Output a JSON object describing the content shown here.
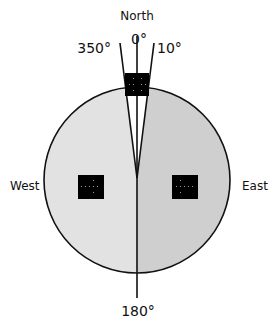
{
  "diagram": {
    "labels": {
      "north": "North",
      "deg0": "0°",
      "deg350": "350°",
      "deg10": "10°",
      "west": "West",
      "east": "East",
      "deg180": "180°"
    },
    "colors": {
      "west_half": "#e2e2e2",
      "east_half": "#cfcfcf",
      "wedge": "#ffffff",
      "stroke": "#111111",
      "marker": "#000000"
    },
    "markers": [
      {
        "name": "north-marker",
        "region": "north wedge"
      },
      {
        "name": "west-marker",
        "region": "west half"
      },
      {
        "name": "east-marker",
        "region": "east half"
      }
    ]
  }
}
